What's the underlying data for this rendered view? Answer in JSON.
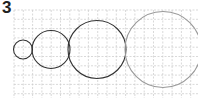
{
  "exercise": {
    "number": "3"
  },
  "grid": {
    "x0": 14,
    "y0": 10,
    "x1": 198,
    "y1": 98,
    "cell": 9.3,
    "color": "#c8c8c8"
  },
  "circles": [
    {
      "cx": 23,
      "cy": 49.5,
      "r": 9.5,
      "stroke": "#333333"
    },
    {
      "cx": 51,
      "cy": 49.5,
      "r": 19,
      "stroke": "#333333"
    },
    {
      "cx": 97,
      "cy": 49.5,
      "r": 29,
      "stroke": "#333333"
    },
    {
      "cx": 163,
      "cy": 49.5,
      "r": 38,
      "stroke": "#999999"
    }
  ]
}
